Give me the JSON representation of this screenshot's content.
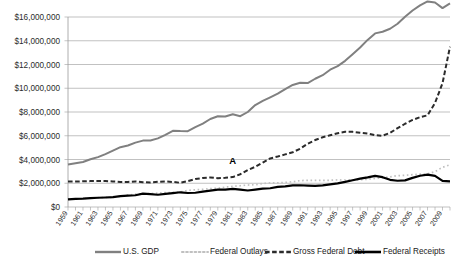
{
  "chart_data": {
    "type": "line",
    "title": "",
    "xlabel": "",
    "ylabel": "",
    "ylim": [
      0,
      16000000
    ],
    "ytick_values": [
      0,
      2000000,
      4000000,
      6000000,
      8000000,
      10000000,
      12000000,
      14000000,
      16000000
    ],
    "ytick_labels": [
      "$0",
      "$2,000,000",
      "$4,000,000",
      "$6,000,000",
      "$8,000,000",
      "$10,000,000",
      "$12,000,000",
      "$14,000,000",
      "$16,000,000"
    ],
    "grid": true,
    "legend_position": "bottom",
    "x": [
      1959,
      1960,
      1961,
      1962,
      1963,
      1964,
      1965,
      1966,
      1967,
      1968,
      1969,
      1970,
      1971,
      1972,
      1973,
      1974,
      1975,
      1976,
      1977,
      1978,
      1979,
      1980,
      1981,
      1982,
      1983,
      1984,
      1985,
      1986,
      1987,
      1988,
      1989,
      1990,
      1991,
      1992,
      1993,
      1994,
      1995,
      1996,
      1997,
      1998,
      1999,
      2000,
      2001,
      2002,
      2003,
      2004,
      2005,
      2006,
      2007,
      2008,
      2009,
      2010
    ],
    "xtick_labels": [
      "1959",
      "1961",
      "1963",
      "1965",
      "1967",
      "1969",
      "1971",
      "1973",
      "1975",
      "1977",
      "1979",
      "1981",
      "1983",
      "1985",
      "1987",
      "1989",
      "1991",
      "1993",
      "1995",
      "1997",
      "1999",
      "2001",
      "2003",
      "2005",
      "2007",
      "2009"
    ],
    "series": [
      {
        "name": "U.S. GDP",
        "color": "#808080",
        "style": "solid",
        "width": 2.0,
        "values": [
          3580000,
          3680000,
          3790000,
          4020000,
          4200000,
          4450000,
          4740000,
          5040000,
          5180000,
          5420000,
          5590000,
          5600000,
          5780000,
          6080000,
          6420000,
          6390000,
          6380000,
          6720000,
          7020000,
          7410000,
          7640000,
          7620000,
          7810000,
          7650000,
          8000000,
          8580000,
          8930000,
          9230000,
          9540000,
          9930000,
          10280000,
          10470000,
          10440000,
          10800000,
          11100000,
          11560000,
          11860000,
          12310000,
          12860000,
          13430000,
          14070000,
          14620000,
          14760000,
          15010000,
          15430000,
          16020000,
          16550000,
          16980000,
          17310000,
          17220000,
          16750000,
          17150000
        ]
      },
      {
        "name": "Federal Outlays",
        "color": "#c0c0c0",
        "style": "dotted",
        "width": 1.7,
        "values": [
          640000,
          660000,
          700000,
          760000,
          780000,
          810000,
          810000,
          890000,
          1000000,
          1080000,
          1080000,
          1130000,
          1170000,
          1210000,
          1230000,
          1260000,
          1400000,
          1450000,
          1490000,
          1550000,
          1570000,
          1680000,
          1740000,
          1790000,
          1850000,
          1880000,
          1980000,
          2030000,
          2030000,
          2070000,
          2130000,
          2220000,
          2250000,
          2250000,
          2250000,
          2250000,
          2280000,
          2270000,
          2290000,
          2290000,
          2340000,
          2410000,
          2450000,
          2540000,
          2640000,
          2670000,
          2720000,
          2760000,
          2790000,
          2980000,
          3340000,
          3550000
        ]
      },
      {
        "name": "Gross Federal Debt",
        "color": "#2b2b2b",
        "style": "dashed",
        "width": 2.0,
        "values": [
          2140000,
          2150000,
          2160000,
          2180000,
          2180000,
          2180000,
          2150000,
          2110000,
          2110000,
          2150000,
          2090000,
          2070000,
          2120000,
          2150000,
          2110000,
          2040000,
          2180000,
          2350000,
          2450000,
          2490000,
          2420000,
          2460000,
          2520000,
          2760000,
          3120000,
          3380000,
          3740000,
          4090000,
          4250000,
          4430000,
          4610000,
          4910000,
          5330000,
          5640000,
          5870000,
          6040000,
          6210000,
          6330000,
          6330000,
          6260000,
          6190000,
          6050000,
          6000000,
          6240000,
          6640000,
          7010000,
          7330000,
          7560000,
          7720000,
          8760000,
          10420000,
          13500000
        ]
      },
      {
        "name": "Federal Receipts",
        "color": "#000000",
        "style": "solid",
        "width": 2.2,
        "values": [
          640000,
          690000,
          700000,
          740000,
          780000,
          800000,
          830000,
          910000,
          950000,
          990000,
          1120000,
          1090000,
          1030000,
          1110000,
          1170000,
          1240000,
          1180000,
          1200000,
          1290000,
          1380000,
          1460000,
          1470000,
          1530000,
          1470000,
          1390000,
          1460000,
          1540000,
          1580000,
          1700000,
          1740000,
          1820000,
          1830000,
          1800000,
          1780000,
          1820000,
          1900000,
          1990000,
          2110000,
          2250000,
          2390000,
          2490000,
          2620000,
          2510000,
          2290000,
          2210000,
          2240000,
          2450000,
          2630000,
          2730000,
          2620000,
          2200000,
          2160000
        ]
      }
    ],
    "annotations": [
      {
        "text": "A",
        "x_value": 1981,
        "y_value": 3620000
      }
    ]
  },
  "legend": {
    "items": [
      {
        "label": "U.S. GDP",
        "key": 0
      },
      {
        "label": "Federal Outlays",
        "key": 1
      },
      {
        "label": "Gross Federal Debt",
        "key": 2
      },
      {
        "label": "Federal Receipts",
        "key": 3
      }
    ]
  }
}
